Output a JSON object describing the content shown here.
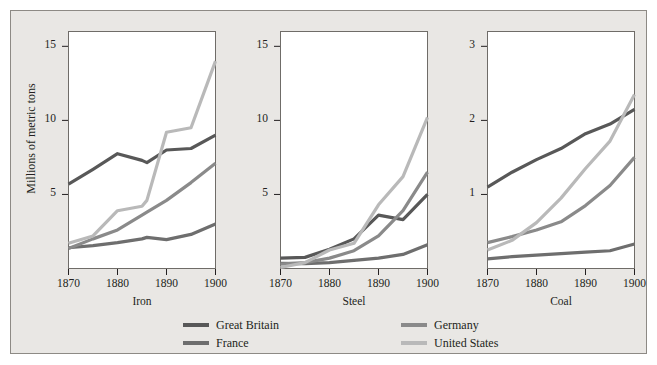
{
  "figure": {
    "ylabel": "Millions of metric tons",
    "background": "#e9e7e4",
    "border_color": "#8d8a85",
    "panel_background": "#ffffff"
  },
  "series_styles": [
    {
      "name": "Great Britain",
      "color": "#585858",
      "width": 3.2
    },
    {
      "name": "France",
      "color": "#6e6e6e",
      "width": 3.2
    },
    {
      "name": "Germany",
      "color": "#8a8a8a",
      "width": 3.2
    },
    {
      "name": "United States",
      "color": "#b9b9b9",
      "width": 3.2
    }
  ],
  "legend": {
    "items": [
      {
        "label": "Great Britain",
        "color": "#585858"
      },
      {
        "label": "Germany",
        "color": "#8a8a8a"
      },
      {
        "label": "France",
        "color": "#6e6e6e"
      },
      {
        "label": "United States",
        "color": "#b9b9b9"
      }
    ]
  },
  "chart_data": [
    {
      "type": "line",
      "title": "Iron",
      "xlabel": "Iron",
      "ylabel": "Millions of metric tons",
      "x": [
        1870,
        1875,
        1880,
        1885,
        1886,
        1890,
        1895,
        1900
      ],
      "xlim": [
        1870,
        1900
      ],
      "ylim": [
        0,
        16
      ],
      "xticks": [
        1870,
        1880,
        1890,
        1900
      ],
      "yticks": [
        5,
        10,
        15
      ],
      "grid": false,
      "series": [
        {
          "name": "Great Britain",
          "values": [
            5.7,
            6.7,
            7.75,
            7.3,
            7.15,
            8.0,
            8.1,
            9.0
          ]
        },
        {
          "name": "France",
          "values": [
            1.4,
            1.55,
            1.75,
            2.0,
            2.1,
            1.95,
            2.3,
            3.0
          ]
        },
        {
          "name": "Germany",
          "values": [
            1.35,
            2.0,
            2.6,
            3.6,
            3.8,
            4.6,
            5.8,
            7.1
          ]
        },
        {
          "name": "United States",
          "values": [
            1.7,
            2.2,
            3.9,
            4.2,
            4.6,
            9.2,
            9.5,
            14.0
          ]
        }
      ]
    },
    {
      "type": "line",
      "title": "Steel",
      "xlabel": "Steel",
      "ylabel": "Millions of metric tons",
      "x": [
        1870,
        1875,
        1880,
        1885,
        1890,
        1895,
        1900
      ],
      "xlim": [
        1870,
        1900
      ],
      "ylim": [
        0,
        16
      ],
      "xticks": [
        1870,
        1880,
        1890,
        1900
      ],
      "yticks": [
        5,
        10,
        15
      ],
      "grid": false,
      "series": [
        {
          "name": "Great Britain",
          "values": [
            0.7,
            0.75,
            1.3,
            2.0,
            3.6,
            3.3,
            5.0
          ]
        },
        {
          "name": "France",
          "values": [
            0.35,
            0.33,
            0.4,
            0.55,
            0.7,
            0.95,
            1.6
          ]
        },
        {
          "name": "Germany",
          "values": [
            0.3,
            0.4,
            0.7,
            1.2,
            2.2,
            3.9,
            6.5
          ]
        },
        {
          "name": "United States",
          "values": [
            0.07,
            0.4,
            1.25,
            1.7,
            4.3,
            6.2,
            10.2
          ]
        }
      ]
    },
    {
      "type": "line",
      "title": "Coal",
      "xlabel": "Coal",
      "ylabel": "Millions of metric tons",
      "x": [
        1870,
        1875,
        1880,
        1885,
        1890,
        1895,
        1900
      ],
      "xlim": [
        1870,
        1900
      ],
      "ylim": [
        0,
        3.2
      ],
      "xticks": [
        1870,
        1880,
        1890,
        1900
      ],
      "yticks": [
        1,
        2,
        3
      ],
      "grid": false,
      "series": [
        {
          "name": "Great Britain",
          "values": [
            1.1,
            1.3,
            1.47,
            1.62,
            1.82,
            1.95,
            2.15
          ]
        },
        {
          "name": "France",
          "values": [
            0.13,
            0.16,
            0.18,
            0.2,
            0.22,
            0.24,
            0.33
          ]
        },
        {
          "name": "Germany",
          "values": [
            0.35,
            0.43,
            0.52,
            0.63,
            0.85,
            1.12,
            1.5
          ]
        },
        {
          "name": "United States",
          "values": [
            0.25,
            0.38,
            0.62,
            0.95,
            1.35,
            1.72,
            2.35
          ]
        }
      ]
    }
  ]
}
